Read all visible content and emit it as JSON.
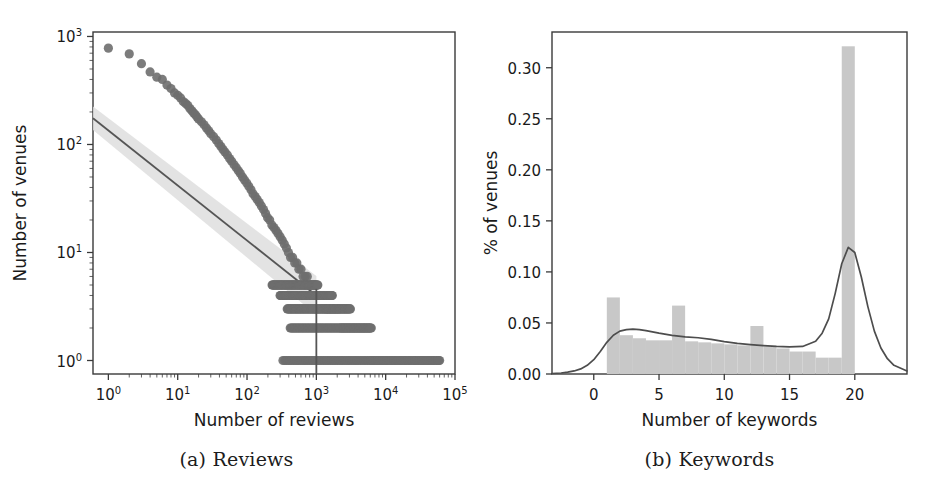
{
  "figure": {
    "background": "#ffffff",
    "panels": [
      {
        "caption": "(a) Reviews"
      },
      {
        "caption": "(b) Keywords"
      }
    ]
  },
  "colors": {
    "scatter": "#6e6e6e",
    "fit_line": "#555555",
    "ci_band": "#dedede",
    "bar": "#c8c8c8",
    "kde_line": "#4d4d4d",
    "axis": "#3a3a3a",
    "text": "#1a1a1a"
  },
  "chart_data": [
    {
      "id": "reviews",
      "type": "scatter",
      "title": "(a) Reviews",
      "xlabel": "Number of reviews",
      "ylabel": "Number of venues",
      "xscale": "log",
      "yscale": "log",
      "xlim": [
        0.6,
        100000
      ],
      "ylim": [
        0.75,
        1100
      ],
      "xticklabels": [
        "10^0",
        "10^1",
        "10^2",
        "10^3",
        "10^4",
        "10^5"
      ],
      "xtickvalues": [
        1,
        10,
        100,
        1000,
        10000,
        100000
      ],
      "yticklabels": [
        "10^0",
        "10^1",
        "10^2",
        "10^3"
      ],
      "ytickvalues": [
        1,
        10,
        100,
        1000
      ],
      "grid": false,
      "legend": null,
      "points": [
        [
          1,
          780
        ],
        [
          2,
          690
        ],
        [
          3,
          560
        ],
        [
          4,
          470
        ],
        [
          5,
          420
        ],
        [
          6,
          400
        ],
        [
          7,
          355
        ],
        [
          8,
          330
        ],
        [
          9,
          300
        ],
        [
          10,
          285
        ],
        [
          11,
          270
        ],
        [
          12,
          250
        ],
        [
          13,
          240
        ],
        [
          14,
          230
        ],
        [
          15,
          215
        ],
        [
          16,
          205
        ],
        [
          17,
          196
        ],
        [
          18,
          188
        ],
        [
          19,
          180
        ],
        [
          20,
          172
        ],
        [
          22,
          162
        ],
        [
          24,
          152
        ],
        [
          26,
          142
        ],
        [
          28,
          134
        ],
        [
          30,
          126
        ],
        [
          33,
          118
        ],
        [
          36,
          110
        ],
        [
          39,
          102
        ],
        [
          42,
          96
        ],
        [
          45,
          90
        ],
        [
          48,
          85
        ],
        [
          52,
          80
        ],
        [
          56,
          74
        ],
        [
          60,
          70
        ],
        [
          65,
          65
        ],
        [
          70,
          61
        ],
        [
          75,
          57
        ],
        [
          80,
          54
        ],
        [
          86,
          50
        ],
        [
          92,
          47
        ],
        [
          99,
          44
        ],
        [
          106,
          41
        ],
        [
          114,
          38
        ],
        [
          122,
          35
        ],
        [
          131,
          33
        ],
        [
          140,
          31
        ],
        [
          150,
          29
        ],
        [
          161,
          27
        ],
        [
          173,
          25
        ],
        [
          185,
          23
        ],
        [
          198,
          21
        ],
        [
          212,
          20
        ],
        [
          228,
          18
        ],
        [
          244,
          17
        ],
        [
          262,
          16
        ],
        [
          280,
          15
        ],
        [
          300,
          14
        ],
        [
          322,
          13
        ],
        [
          345,
          12
        ],
        [
          370,
          11
        ],
        [
          396,
          10
        ],
        [
          425,
          9
        ],
        [
          455,
          9
        ],
        [
          488,
          8
        ],
        [
          523,
          8
        ],
        [
          560,
          7
        ],
        [
          600,
          7
        ],
        [
          643,
          6
        ],
        [
          690,
          6
        ],
        [
          740,
          6
        ],
        [
          793,
          5
        ],
        [
          850,
          5
        ],
        [
          911,
          5
        ],
        [
          977,
          5
        ],
        [
          1047,
          4
        ],
        [
          1123,
          4
        ],
        [
          1204,
          4
        ],
        [
          1290,
          4
        ],
        [
          1384,
          3
        ],
        [
          1483,
          3
        ],
        [
          1590,
          3
        ],
        [
          1705,
          3
        ],
        [
          1828,
          3
        ],
        [
          1960,
          3
        ],
        [
          2100,
          3
        ],
        [
          2252,
          2
        ],
        [
          2414,
          2
        ],
        [
          2589,
          2
        ],
        [
          2775,
          2
        ],
        [
          2975,
          2
        ],
        [
          3190,
          2
        ],
        [
          3420,
          2
        ],
        [
          3667,
          2
        ],
        [
          3931,
          2
        ],
        [
          4215,
          2
        ],
        [
          4519,
          2
        ],
        [
          4845,
          2
        ],
        [
          5194,
          2
        ],
        [
          5569,
          2
        ],
        [
          5971,
          2
        ],
        [
          6400,
          1
        ],
        [
          7000,
          1
        ],
        [
          8000,
          1
        ],
        [
          9000,
          1
        ],
        [
          10500,
          1
        ],
        [
          12000,
          1
        ],
        [
          14000,
          1
        ],
        [
          16500,
          1
        ],
        [
          19000,
          1
        ],
        [
          22000,
          1
        ],
        [
          26000,
          1
        ],
        [
          30000,
          1
        ],
        [
          35000,
          1
        ],
        [
          41000,
          1
        ],
        [
          48000,
          1
        ],
        [
          58000,
          1
        ]
      ],
      "fit_line": {
        "description": "power-law fit with confidence band",
        "x_start": 0.6,
        "y_start": 175,
        "x_end": 1000,
        "y_end": 4.0,
        "ci_spread": 0.18
      },
      "vertical_marker": {
        "x": 1000,
        "y_top": 4.6,
        "y_bottom": 0.75
      }
    },
    {
      "id": "keywords",
      "type": "bar",
      "title": "(b) Keywords",
      "xlabel": "Number of keywords",
      "ylabel": "% of venues",
      "xlim": [
        -3.2,
        24.0
      ],
      "ylim": [
        0.0,
        0.335
      ],
      "xticklabels": [
        "0",
        "5",
        "10",
        "15",
        "20"
      ],
      "xtickvalues": [
        0,
        5,
        10,
        15,
        20
      ],
      "yticklabels": [
        "0.00",
        "0.05",
        "0.10",
        "0.15",
        "0.20",
        "0.25",
        "0.30"
      ],
      "ytickvalues": [
        0.0,
        0.05,
        0.1,
        0.15,
        0.2,
        0.25,
        0.3
      ],
      "grid": false,
      "legend": null,
      "bar_edges": [
        1,
        2,
        3,
        4,
        5,
        6,
        7,
        8,
        9,
        10,
        11,
        12,
        13,
        14,
        15,
        16,
        17,
        18,
        19,
        20
      ],
      "categories": [
        1,
        2,
        3,
        4,
        5,
        6,
        7,
        8,
        9,
        10,
        11,
        12,
        13,
        14,
        15,
        16,
        17,
        18,
        19
      ],
      "values": [
        0.075,
        0.038,
        0.035,
        0.033,
        0.033,
        0.067,
        0.032,
        0.031,
        0.03,
        0.029,
        0.028,
        0.047,
        0.027,
        0.025,
        0.022,
        0.022,
        0.016,
        0.016,
        0.321
      ],
      "kde": {
        "name": "density estimate",
        "x": [
          -3.2,
          -2.5,
          -2.0,
          -1.5,
          -1.0,
          -0.5,
          0.0,
          0.5,
          1.0,
          1.5,
          2.0,
          2.5,
          3.0,
          3.5,
          4.0,
          5.0,
          6.0,
          7.0,
          8.0,
          9.0,
          10.0,
          11.0,
          12.0,
          13.0,
          14.0,
          15.0,
          16.0,
          17.0,
          17.5,
          18.0,
          18.5,
          19.0,
          19.5,
          20.0,
          20.5,
          21.0,
          21.5,
          22.0,
          22.5,
          23.0,
          24.0
        ],
        "y": [
          0.0005,
          0.001,
          0.0018,
          0.003,
          0.005,
          0.0085,
          0.014,
          0.022,
          0.031,
          0.038,
          0.042,
          0.0435,
          0.044,
          0.0435,
          0.0425,
          0.04,
          0.0378,
          0.0363,
          0.0355,
          0.034,
          0.0318,
          0.03,
          0.0288,
          0.0278,
          0.027,
          0.0265,
          0.027,
          0.032,
          0.04,
          0.054,
          0.079,
          0.108,
          0.124,
          0.119,
          0.095,
          0.066,
          0.042,
          0.0255,
          0.015,
          0.0085,
          0.003
        ],
        "peak_x": 19.5,
        "peak_y": 0.124
      }
    }
  ]
}
